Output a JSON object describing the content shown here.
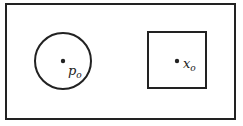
{
  "diagram": {
    "outer_frame": {
      "x": 6,
      "y": 4,
      "width": 229,
      "height": 115
    },
    "circle": {
      "cx": 63,
      "cy": 61,
      "r": 28,
      "point": {
        "label": "p",
        "subscript": "o"
      }
    },
    "square": {
      "x": 148,
      "y": 32,
      "width": 58,
      "height": 56,
      "point": {
        "label": "x",
        "subscript": "o"
      }
    },
    "stroke_color": "#222222"
  }
}
